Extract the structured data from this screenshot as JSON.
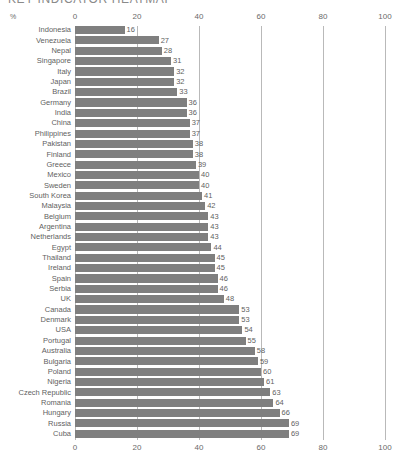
{
  "title": "KEY INDICATOR HEATMAP",
  "axis_unit_label": "%",
  "chart_data": {
    "type": "bar",
    "orientation": "horizontal",
    "title": "KEY INDICATOR HEATMAP",
    "xlabel": "%",
    "ylabel": "",
    "xlim": [
      0,
      100
    ],
    "xticks": [
      0,
      20,
      40,
      60,
      80,
      100
    ],
    "grid": true,
    "legend": "none",
    "bar_color": "#7f7f7f",
    "categories": [
      "Indonesia",
      "Venezuela",
      "Nepal",
      "Singapore",
      "Italy",
      "Japan",
      "Brazil",
      "Germany",
      "India",
      "China",
      "Philippines",
      "Pakistan",
      "Finland",
      "Greece",
      "Mexico",
      "Sweden",
      "South Korea",
      "Malaysia",
      "Belgium",
      "Argentina",
      "Netherlands",
      "Egypt",
      "Thailand",
      "Ireland",
      "Spain",
      "Serbia",
      "UK",
      "Canada",
      "Denmark",
      "USA",
      "Portugal",
      "Australia",
      "Bulgaria",
      "Poland",
      "Nigeria",
      "Czech Republic",
      "Romania",
      "Hungary",
      "Russia",
      "Cuba"
    ],
    "values": [
      16,
      27,
      28,
      31,
      32,
      32,
      33,
      36,
      36,
      37,
      37,
      38,
      38,
      39,
      40,
      40,
      41,
      42,
      43,
      43,
      43,
      44,
      45,
      45,
      46,
      46,
      48,
      53,
      53,
      54,
      55,
      58,
      59,
      60,
      61,
      63,
      64,
      66,
      69,
      69
    ]
  }
}
